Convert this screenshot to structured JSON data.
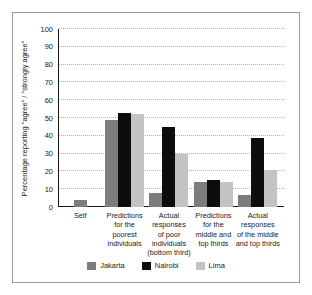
{
  "chart_data": {
    "type": "bar",
    "title": "",
    "xlabel": "",
    "ylabel": "Percentage reporting \"agree\" / \"strongly agree\"",
    "ylim": [
      0,
      100
    ],
    "yticks": [
      0,
      10,
      20,
      30,
      40,
      50,
      60,
      70,
      80,
      90,
      100
    ],
    "grid": true,
    "legend_position": "bottom",
    "categories": [
      "Self",
      "Predictions for the poorest individuals",
      "Actual responses of poor individuals (bottom third)",
      "Predictions for the middle and top thirds",
      "Actual responses of the middle and top thirds"
    ],
    "category_lines": [
      [
        "Self"
      ],
      [
        "Predictions",
        "for the",
        "poorest",
        "individuals"
      ],
      [
        "Actual",
        "responses",
        "of poor",
        "individuals",
        "(bottom third)"
      ],
      [
        "Predictions",
        "for the",
        "middle and",
        "top thirds"
      ],
      [
        "Actual",
        "responses",
        "of the middle",
        "and top thirds"
      ]
    ],
    "series": [
      {
        "name": "Jakarta",
        "color": "#7d7d7d",
        "values": [
          4,
          49,
          8,
          14,
          7
        ]
      },
      {
        "name": "Nairobi",
        "color": "#0d0d0d",
        "values": [
          null,
          53,
          45,
          15,
          39
        ]
      },
      {
        "name": "Lima",
        "color": "#c3c3c3",
        "values": [
          null,
          52,
          30,
          14,
          21
        ]
      }
    ]
  },
  "legend": {
    "items": [
      {
        "label": "Jakarta",
        "color": "#7d7d7d"
      },
      {
        "label": "Nairobi",
        "color": "#0d0d0d"
      },
      {
        "label": "Lima",
        "color": "#c3c3c3"
      }
    ]
  },
  "axis": {
    "y_title": "Percentage reporting \"agree\" / \"strongly agree\""
  }
}
